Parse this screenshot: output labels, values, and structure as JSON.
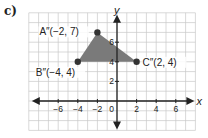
{
  "part_label": "c)",
  "graph": {
    "origin_px": [
      117,
      101
    ],
    "unit_px": 9.8,
    "x_range": [
      -9,
      8
    ],
    "y_range": [
      -3,
      9
    ],
    "axis_labels": {
      "x": "x",
      "y": "y"
    },
    "x_ticks": [
      {
        "value": -6,
        "label": "−6"
      },
      {
        "value": -4,
        "label": "−4"
      },
      {
        "value": -2,
        "label": "−2"
      },
      {
        "value": 2,
        "label": "2"
      },
      {
        "value": 4,
        "label": "4"
      },
      {
        "value": 6,
        "label": "6"
      }
    ],
    "y_ticks": [
      {
        "value": 2,
        "label": "2"
      },
      {
        "value": 4,
        "label": "4"
      },
      {
        "value": 6,
        "label": "6"
      }
    ],
    "origin_label": "0",
    "colors": {
      "grid": "#c8c8c8",
      "axis": "#222222",
      "fill": "#7a7a7a",
      "point": "#333333",
      "text": "#222222"
    }
  },
  "triangle": {
    "points": [
      {
        "name": "A''",
        "label": "A″(−2, 7)",
        "x": -2,
        "y": 7,
        "label_dx": -58,
        "label_dy": 3
      },
      {
        "name": "B''",
        "label": "B″(−4, 4)",
        "x": -4,
        "y": 4,
        "label_dx": -42,
        "label_dy": 14
      },
      {
        "name": "C''",
        "label": "C″(2, 4)",
        "x": 2,
        "y": 4,
        "label_dx": 6,
        "label_dy": 4
      }
    ]
  }
}
